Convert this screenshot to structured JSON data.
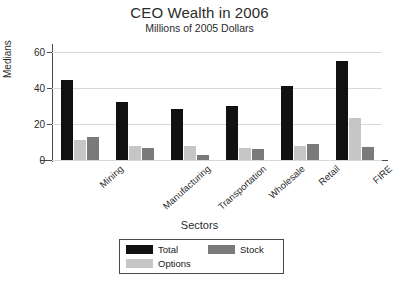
{
  "chart_data": {
    "type": "bar",
    "title": "CEO Wealth in 2006",
    "subtitle": "Millions of 2005 Dollars",
    "xlabel": "Sectors",
    "ylabel": "Medians",
    "ylim": [
      0,
      62
    ],
    "yticks": [
      0,
      20,
      40,
      60
    ],
    "ytick_labels": [
      "0",
      "20",
      "40",
      "60"
    ],
    "grid": true,
    "legend_position": "bottom-center",
    "categories": [
      "Mining",
      "Manufacturing",
      "Transportation",
      "Wholesale",
      "Retail",
      "FIRE"
    ],
    "series": [
      {
        "name": "Total",
        "color": "#111111",
        "values": [
          44.5,
          32,
          28.5,
          30,
          41,
          55
        ]
      },
      {
        "name": "Options",
        "color": "#c6c6c6",
        "values": [
          11,
          8,
          7.5,
          6.5,
          7.5,
          23
        ]
      },
      {
        "name": "Stock",
        "color": "#7a7a7a",
        "values": [
          13,
          6.5,
          3,
          6,
          9,
          7
        ]
      }
    ]
  },
  "legend": {
    "items": [
      {
        "label": "Total",
        "color": "#111111"
      },
      {
        "label": "Options",
        "color": "#c6c6c6"
      },
      {
        "label": "Stock",
        "color": "#7a7a7a"
      }
    ]
  }
}
